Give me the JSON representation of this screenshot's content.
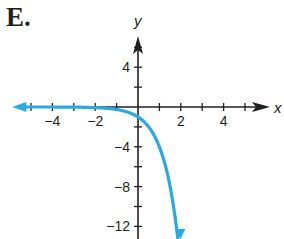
{
  "title": "E.",
  "colors": {
    "axis": "#231f20",
    "curve": "#29a9e1"
  },
  "chart_data": {
    "type": "line",
    "title": "E.",
    "xlabel": "x",
    "ylabel": "y",
    "xlim": [
      -5.5,
      6
    ],
    "ylim": [
      -14,
      7
    ],
    "x_ticks": [
      -5,
      -4,
      -3,
      -2,
      -1,
      1,
      2,
      3,
      4,
      5
    ],
    "x_tick_labels": [
      "-4",
      "-2",
      "2",
      "4"
    ],
    "y_ticks": [
      6,
      4,
      2,
      -2,
      -4,
      -6,
      -8,
      -10,
      -12
    ],
    "y_tick_labels": [
      "4",
      "-4",
      "-8",
      "-12"
    ],
    "grid": false,
    "series": [
      {
        "name": "curve",
        "description": "decreasing exponential-type curve, asymptote y=0 as x→-∞, arrows on both ends",
        "x": [
          -5.5,
          -4,
          -3,
          -2,
          -1,
          0,
          0.5,
          1,
          1.5,
          2
        ],
        "y": [
          0,
          0,
          0,
          -0.1,
          -0.3,
          -1,
          -2,
          -4,
          -7.5,
          -14
        ]
      }
    ]
  }
}
